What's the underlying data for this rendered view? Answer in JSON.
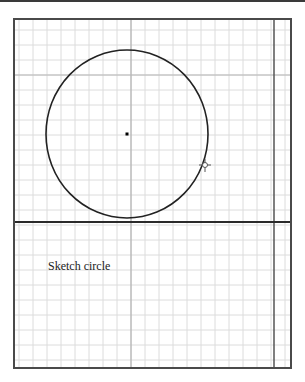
{
  "canvas": {
    "grid": {
      "spacing_x": 14,
      "spacing_y": 15,
      "minor_color": "#d8d8d8",
      "major_color": "#9a9a9a"
    },
    "frame_color": "#4a4a4a",
    "circle": {
      "cx": 127,
      "cy": 134,
      "rx": 81,
      "ry": 84,
      "stroke": "#222222"
    },
    "center_point": {
      "x": 127,
      "y": 134
    },
    "divider_line_y": 222,
    "right_margin_line_x": 274,
    "cursor_icon": "crosshair-pointer"
  },
  "caption": {
    "text": "Sketch circle"
  }
}
